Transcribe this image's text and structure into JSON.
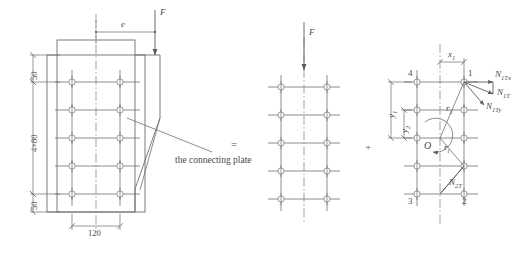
{
  "figure": {
    "type": "engineering-diagram",
    "operators": {
      "equals": "=",
      "plus": "+"
    },
    "annotation": {
      "connecting_plate": "the connecting plate"
    }
  },
  "panel_left": {
    "name": "eccentric-load-panel",
    "labels": {
      "eccentricity": "e",
      "force": "F"
    },
    "dimensions": {
      "top_edge": "50",
      "bolt_rows": "4×80",
      "bottom_edge": "50",
      "bolt_gauge": "120"
    },
    "bolts": {
      "columns": 2,
      "rows": 5,
      "pitch": "80",
      "gauge": "120"
    }
  },
  "panel_center": {
    "name": "concentric-shear-panel",
    "labels": {
      "force": "F"
    },
    "bolts": {
      "columns": 2,
      "rows": 5
    }
  },
  "panel_right": {
    "name": "torsion-panel",
    "labels": {
      "x1": "x",
      "x1_sub": "1",
      "y1": "y",
      "y1_sub": "1",
      "y2": "y",
      "y2_sub": "2",
      "r1": "r",
      "r1_sub": "1",
      "ri": "r",
      "ri_sub": "i",
      "centroid": "O"
    },
    "bolt_numbers": {
      "b1": "1",
      "b2": "2",
      "b3": "3",
      "b4": "4"
    },
    "forces": {
      "n1Tx": {
        "base": "N",
        "sub": "1Tx"
      },
      "n1T": {
        "base": "N",
        "sub": "1T"
      },
      "n1Ty": {
        "base": "N",
        "sub": "1Ty"
      },
      "n2T": {
        "base": "N",
        "sub": "2T"
      }
    },
    "bolts": {
      "columns": 2,
      "rows": 5
    }
  },
  "colors": {
    "line": "#6e6e6e",
    "text": "#4a4a4a",
    "center_line": "#7a7a7a",
    "background": "#ffffff"
  }
}
